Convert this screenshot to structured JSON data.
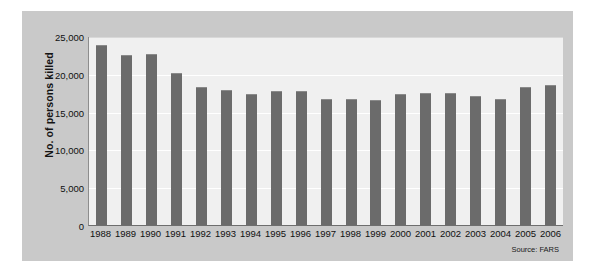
{
  "chart_data": {
    "type": "bar",
    "title": "",
    "subtitle": "",
    "xlabel": "",
    "ylabel": "No. of persons killed",
    "ylim": [
      0,
      25000
    ],
    "yticks": [
      0,
      5000,
      10000,
      15000,
      20000,
      25000
    ],
    "ytick_labels": [
      "0",
      "5,000",
      "10,000",
      "15,000",
      "20,000",
      "25,000"
    ],
    "grid": true,
    "legend": null,
    "categories": [
      "1988",
      "1989",
      "1990",
      "1991",
      "1992",
      "1993",
      "1994",
      "1995",
      "1996",
      "1997",
      "1998",
      "1999",
      "2000",
      "2001",
      "2002",
      "2003",
      "2004",
      "2005",
      "2006"
    ],
    "values": [
      23833,
      22424,
      22587,
      20159,
      18290,
      17908,
      17308,
      17732,
      17749,
      16711,
      16673,
      16572,
      17380,
      17400,
      17524,
      17013,
      16694,
      18217,
      18456
    ],
    "bar_color": "#6b6b6b",
    "plot_background": "#f0f0f0",
    "panel_background": "#c9c9c9",
    "source_note": "Source: FARS"
  },
  "annotations": {
    "source": "Source: FARS"
  }
}
